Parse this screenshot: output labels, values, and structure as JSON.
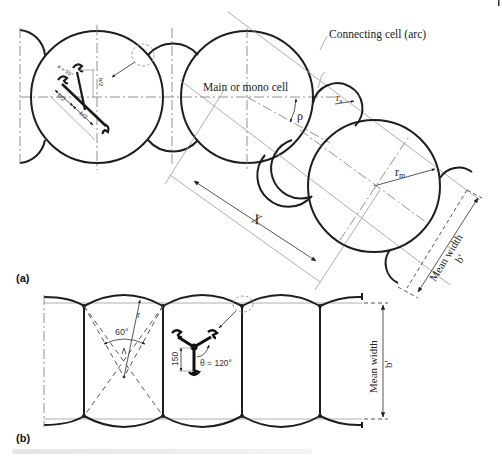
{
  "figure": {
    "panels": [
      {
        "id": "a",
        "label": "(a)",
        "labels": {
          "main_cell": "Main or mono cell",
          "connecting_cell": "Connecting cell (arc)",
          "rho": "ρ",
          "ra": "r",
          "ra_sub": "a",
          "rm": "r",
          "rm_sub": "m",
          "x": "X",
          "mean_width": "Mean width",
          "b_prime": "b'",
          "detail_angle": "a = 55°",
          "detail_half_b1": "b/2",
          "detail_half_b2": "b/2",
          "detail_half_b3": "b/2"
        }
      },
      {
        "id": "b",
        "label": "(b)",
        "labels": {
          "angle_60": "60°",
          "radius": "r",
          "dim_150": "150",
          "theta": "θ = 120°",
          "mean_width": "Mean width",
          "b_prime": "b'"
        }
      }
    ],
    "colors": {
      "outline": "#1e1e1e",
      "construction": "#9a9a9a",
      "background": "#ffffff"
    }
  }
}
